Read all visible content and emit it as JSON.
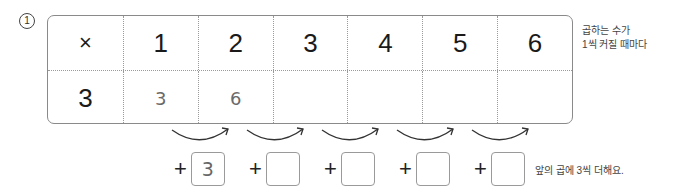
{
  "problem_number": "1",
  "table": {
    "header_row": [
      "×",
      "1",
      "2",
      "3",
      "4",
      "5",
      "6"
    ],
    "answer_row": [
      "3",
      "3",
      "6",
      "",
      "",
      "",
      ""
    ]
  },
  "side_note": {
    "line1": "곱하는 수가",
    "line2": "1씩 커질 때마다"
  },
  "increments": {
    "plus_sign": "+",
    "boxes": [
      "3",
      "",
      "",
      "",
      ""
    ]
  },
  "tip": "앞의 곱에 3씩 더해요."
}
